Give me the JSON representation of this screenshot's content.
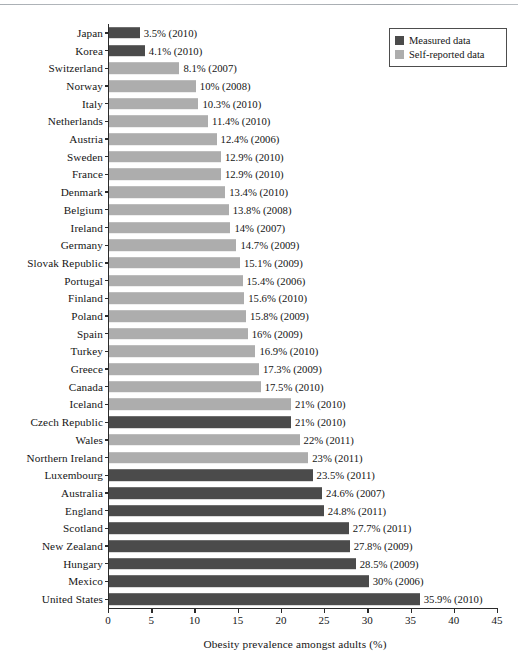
{
  "chart_data": {
    "type": "bar",
    "orientation": "horizontal",
    "title": "",
    "xlabel": "Obesity prevalence amongst adults (%)",
    "ylabel": "",
    "xlim": [
      0,
      45
    ],
    "xticks": [
      0,
      5,
      10,
      15,
      20,
      25,
      30,
      35,
      40,
      45
    ],
    "grid": false,
    "legend_position": "top-right",
    "series": [
      {
        "name": "Measured data",
        "color": "#4b4b4b"
      },
      {
        "name": "Self-reported data",
        "color": "#adadad"
      }
    ],
    "categories": [
      "Japan",
      "Korea",
      "Switzerland",
      "Norway",
      "Italy",
      "Netherlands",
      "Austria",
      "Sweden",
      "France",
      "Denmark",
      "Belgium",
      "Ireland",
      "Germany",
      "Slovak Republic",
      "Portugal",
      "Finland",
      "Poland",
      "Spain",
      "Turkey",
      "Greece",
      "Canada",
      "Iceland",
      "Czech Republic",
      "Wales",
      "Northern Ireland",
      "Luxembourg",
      "Australia",
      "England",
      "Scotland",
      "New Zealand",
      "Hungary",
      "Mexico",
      "United States"
    ],
    "values": [
      3.5,
      4.1,
      8.1,
      10,
      10.3,
      11.4,
      12.4,
      12.9,
      12.9,
      13.4,
      13.8,
      14,
      14.7,
      15.1,
      15.4,
      15.6,
      15.8,
      16,
      16.9,
      17.3,
      17.5,
      21,
      21,
      22,
      23,
      23.5,
      24.6,
      24.8,
      27.7,
      27.8,
      28.5,
      30,
      35.9
    ],
    "years": [
      2010,
      2010,
      2007,
      2008,
      2010,
      2010,
      2006,
      2010,
      2010,
      2010,
      2008,
      2007,
      2009,
      2009,
      2006,
      2010,
      2009,
      2009,
      2010,
      2009,
      2010,
      2010,
      2010,
      2011,
      2011,
      2011,
      2007,
      2011,
      2011,
      2009,
      2009,
      2006,
      2010
    ],
    "point_labels": [
      "3.5% (2010)",
      "4.1% (2010)",
      "8.1% (2007)",
      "10% (2008)",
      "10.3% (2010)",
      "11.4% (2010)",
      "12.4% (2006)",
      "12.9% (2010)",
      "12.9% (2010)",
      "13.4% (2010)",
      "13.8% (2008)",
      "14% (2007)",
      "14.7% (2009)",
      "15.1% (2009)",
      "15.4% (2006)",
      "15.6% (2010)",
      "15.8% (2009)",
      "16% (2009)",
      "16.9% (2010)",
      "17.3% (2009)",
      "17.5% (2010)",
      "21% (2010)",
      "21% (2010)",
      "22% (2011)",
      "23% (2011)",
      "23.5% (2011)",
      "24.6% (2007)",
      "24.8% (2011)",
      "27.7% (2011)",
      "27.8% (2009)",
      "28.5% (2009)",
      "30% (2006)",
      "35.9% (2010)"
    ],
    "series_of_point": [
      "Measured data",
      "Measured data",
      "Self-reported data",
      "Self-reported data",
      "Self-reported data",
      "Self-reported data",
      "Self-reported data",
      "Self-reported data",
      "Self-reported data",
      "Self-reported data",
      "Self-reported data",
      "Self-reported data",
      "Self-reported data",
      "Self-reported data",
      "Self-reported data",
      "Self-reported data",
      "Self-reported data",
      "Self-reported data",
      "Self-reported data",
      "Self-reported data",
      "Self-reported data",
      "Self-reported data",
      "Measured data",
      "Self-reported data",
      "Self-reported data",
      "Measured data",
      "Measured data",
      "Measured data",
      "Measured data",
      "Measured data",
      "Measured data",
      "Measured data",
      "Measured data"
    ]
  },
  "legend": {
    "items": [
      {
        "label": "Measured data",
        "key": "measured"
      },
      {
        "label": "Self-reported data",
        "key": "selfreported"
      }
    ]
  },
  "axis": {
    "x_title": "Obesity prevalence amongst adults (%)",
    "x_tick_labels": [
      "0",
      "5",
      "10",
      "15",
      "20",
      "25",
      "30",
      "35",
      "40",
      "45"
    ]
  }
}
